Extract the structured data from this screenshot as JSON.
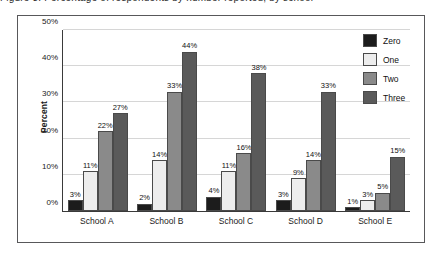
{
  "caption_cutoff": "Figure 3. Percentage of respondents by number reported, by school",
  "chart_data": {
    "type": "bar",
    "title": "",
    "xlabel": "",
    "ylabel": "Percent",
    "ylim": [
      0,
      50
    ],
    "yticks": [
      0,
      10,
      20,
      30,
      40,
      50
    ],
    "ytick_labels": [
      "0%",
      "10%",
      "20%",
      "30%",
      "40%",
      "50%"
    ],
    "grid": true,
    "legend_position": "top-right",
    "categories": [
      "School A",
      "School B",
      "School C",
      "School D",
      "School E"
    ],
    "series": [
      {
        "name": "Zero",
        "color": "#1c1c1c",
        "values": [
          3,
          2,
          4,
          3,
          1
        ],
        "labels": [
          "3%",
          "2%",
          "4%",
          "3%",
          "1%"
        ]
      },
      {
        "name": "One",
        "color": "#ededed",
        "values": [
          11,
          14,
          11,
          9,
          3
        ],
        "labels": [
          "11%",
          "14%",
          "11%",
          "9%",
          "3%"
        ]
      },
      {
        "name": "Two",
        "color": "#8a8a8a",
        "values": [
          22,
          33,
          16,
          14,
          5
        ],
        "labels": [
          "22%",
          "33%",
          "16%",
          "14%",
          "5%"
        ]
      },
      {
        "name": "Three",
        "color": "#5a5a5a",
        "values": [
          27,
          44,
          38,
          33,
          15
        ],
        "labels": [
          "27%",
          "44%",
          "38%",
          "33%",
          "15%"
        ]
      }
    ]
  }
}
